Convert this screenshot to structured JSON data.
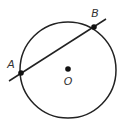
{
  "diagram": {
    "circle": {
      "cx": 68,
      "cy": 70,
      "r": 48,
      "stroke": "#222222"
    },
    "center": {
      "label": "O",
      "x": 68,
      "y": 69,
      "label_x": 68,
      "label_y": 85
    },
    "line": {
      "x1": 9,
      "y1": 81,
      "x2": 106,
      "y2": 19
    },
    "points": [
      {
        "label": "A",
        "x": 21,
        "y": 73,
        "label_x": 11,
        "label_y": 68
      },
      {
        "label": "B",
        "x": 94,
        "y": 27,
        "label_x": 94,
        "label_y": 16
      }
    ]
  }
}
